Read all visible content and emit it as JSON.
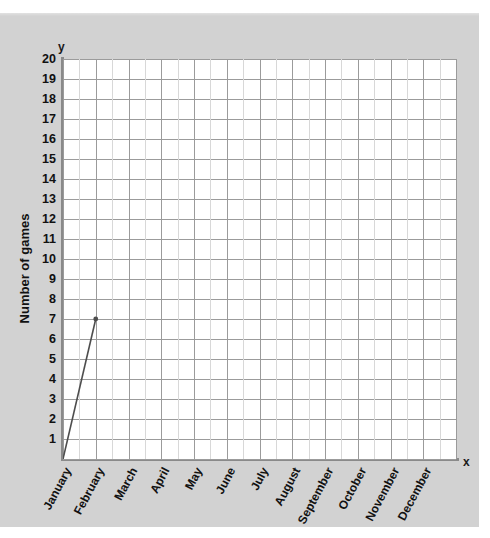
{
  "chart_data": {
    "type": "line",
    "title": "",
    "xlabel": "x",
    "ylabel": "Number of games",
    "y_axis_letter": "y",
    "x_axis_letter": "x",
    "categories": [
      "January",
      "February",
      "March",
      "April",
      "May",
      "June",
      "July",
      "August",
      "September",
      "October",
      "November",
      "December"
    ],
    "x_tick_labels": [
      "January",
      "February",
      "March",
      "April",
      "May",
      "June",
      "July",
      "August",
      "September",
      "October",
      "November",
      "December"
    ],
    "y_tick_labels": [
      "20",
      "19",
      "18",
      "17",
      "16",
      "15",
      "14",
      "13",
      "12",
      "11",
      "10",
      "9",
      "8",
      "7",
      "6",
      "5",
      "4",
      "3",
      "2",
      "1"
    ],
    "ylim": [
      0,
      20
    ],
    "y_major_step": 1,
    "x_minor_per_category": 2,
    "grid": true,
    "legend": null,
    "series": [
      {
        "name": "Number of games",
        "points": [
          {
            "x": "origin",
            "x_index": -1,
            "y": 0
          },
          {
            "x": "February",
            "x_index": 1,
            "y": 7
          }
        ],
        "values": [
          null,
          7,
          null,
          null,
          null,
          null,
          null,
          null,
          null,
          null,
          null,
          null
        ],
        "marker": "dot",
        "color": "#4d4d4d"
      }
    ],
    "colors": {
      "background": "#d2d2d2",
      "plot_background": "#ffffff",
      "grid_major": "#9b9b9b",
      "grid_minor": "#d8d8d8",
      "axis": "#8a8a8a",
      "line": "#4d4d4d",
      "text": "#111111"
    }
  }
}
